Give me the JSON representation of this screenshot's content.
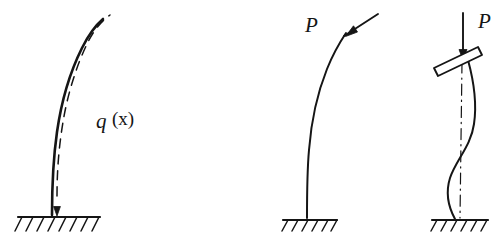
{
  "figure": {
    "background_color": "#ffffff",
    "ink_color": "#151515",
    "width": 501,
    "height": 251
  },
  "panels": [
    {
      "id": "panel-distributed-load",
      "name": "cantilever-with-distributed-load",
      "label": "q",
      "label_suffix": "(x)",
      "description": "Cantilever column curved to the right under distributed load q(x) with dashed load line and downward arrow at base",
      "support": "fixed-hatched-ground"
    },
    {
      "id": "panel-axial-load",
      "name": "cantilever-with-axial-load-P",
      "label": "P",
      "description": "Slender column deflected under inclined axial force P applied at the free top end",
      "support": "fixed-hatched-ground"
    },
    {
      "id": "panel-buckled-plate",
      "name": "buckled-column-with-rigid-plate",
      "label": "P",
      "description": "Buckled column in S-shaped second mode with tilted rigid plate at top loaded by vertical force P; dash-dot centerline shown",
      "support": "fixed-hatched-ground"
    }
  ],
  "annotations": {
    "q_of_x": "q",
    "q_of_x_arg": "(x)",
    "p_middle": "P",
    "p_right": "P"
  }
}
